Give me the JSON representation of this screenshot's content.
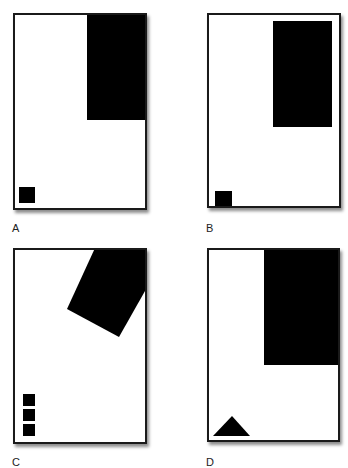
{
  "panels": [
    {
      "label": "A",
      "description": "Large rectangle in top-right corner, small square in bottom-left"
    },
    {
      "label": "B",
      "description": "Large rectangle inset from top-right, small square touching bottom-left edge"
    },
    {
      "label": "C",
      "description": "Rotated rectangle at top-right, three stacked small squares bottom-left"
    },
    {
      "label": "D",
      "description": "Large rectangle in top-right, triangle in bottom-left"
    }
  ],
  "colors": {
    "shape": "#000000",
    "frame": "#1a1a1a",
    "background": "#ffffff"
  }
}
